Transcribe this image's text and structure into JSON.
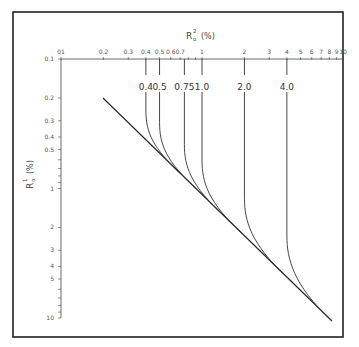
{
  "chart_data": {
    "type": "line",
    "title": "",
    "xlabel": "R_o^2 (%)",
    "ylabel": "R_o^1 (%)",
    "x_scale": "log",
    "y_scale": "log",
    "xlim": [
      0.1,
      10
    ],
    "ylim": [
      0.1,
      10
    ],
    "y_inverted": true,
    "x_axis_position": "top",
    "grid": false,
    "x_ticks": [
      {
        "value": 0.1,
        "label": "01"
      },
      {
        "value": 0.2,
        "label": "0.2"
      },
      {
        "value": 0.3,
        "label": "0.3"
      },
      {
        "value": 0.4,
        "label": "0.4"
      },
      {
        "value": 0.5,
        "label": "0.5"
      },
      {
        "value": 0.6,
        "label": "0.6"
      },
      {
        "value": 0.7,
        "label": "0.7"
      },
      {
        "value": 1,
        "label": "1"
      },
      {
        "value": 2,
        "label": "2"
      },
      {
        "value": 3,
        "label": "3"
      },
      {
        "value": 4,
        "label": "4"
      },
      {
        "value": 5,
        "label": "5"
      },
      {
        "value": 6,
        "label": "6"
      },
      {
        "value": 7,
        "label": "7"
      },
      {
        "value": 8,
        "label": "8"
      },
      {
        "value": 9,
        "label": "9"
      },
      {
        "value": 10,
        "label": "10"
      }
    ],
    "y_ticks": [
      {
        "value": 0.1,
        "label": "0.1"
      },
      {
        "value": 0.2,
        "label": "0.2"
      },
      {
        "value": 0.3,
        "label": "0.3"
      },
      {
        "value": 0.4,
        "label": "0.4"
      },
      {
        "value": 0.5,
        "label": "0.5"
      },
      {
        "value": 1,
        "label": "1"
      },
      {
        "value": 2,
        "label": "2"
      },
      {
        "value": 3,
        "label": "3"
      },
      {
        "value": 4,
        "label": "4"
      },
      {
        "value": 5,
        "label": "5"
      },
      {
        "value": 10,
        "label": "10"
      }
    ],
    "diagonal_line": {
      "name": "asymptote",
      "points": [
        [
          0.2,
          0.2
        ],
        [
          8.5,
          9.5
        ]
      ]
    },
    "series": [
      {
        "name": "0.4",
        "label": "0.4",
        "asymptote_x": 0.4,
        "points": [
          [
            0.4,
            0.2
          ],
          [
            0.4,
            0.35
          ],
          [
            0.42,
            0.5
          ],
          [
            0.5,
            0.6
          ],
          [
            0.7,
            0.8
          ]
        ]
      },
      {
        "name": "0.5",
        "label": "0.5",
        "asymptote_x": 0.5,
        "points": [
          [
            0.5,
            0.2
          ],
          [
            0.5,
            0.4
          ],
          [
            0.53,
            0.6
          ],
          [
            0.65,
            0.75
          ],
          [
            0.9,
            1.0
          ]
        ]
      },
      {
        "name": "0.75",
        "label": "0.75",
        "asymptote_x": 0.75,
        "points": [
          [
            0.75,
            0.2
          ],
          [
            0.75,
            0.55
          ],
          [
            0.8,
            0.9
          ],
          [
            1.0,
            1.15
          ],
          [
            1.5,
            1.6
          ]
        ]
      },
      {
        "name": "1.0",
        "label": "1.0",
        "asymptote_x": 1.0,
        "points": [
          [
            1.0,
            0.2
          ],
          [
            1.0,
            0.7
          ],
          [
            1.07,
            1.1
          ],
          [
            1.4,
            1.5
          ],
          [
            2.0,
            2.1
          ]
        ]
      },
      {
        "name": "2.0",
        "label": "2.0",
        "asymptote_x": 2.0,
        "points": [
          [
            2.0,
            0.2
          ],
          [
            2.0,
            1.2
          ],
          [
            2.05,
            1.9
          ],
          [
            2.5,
            2.6
          ],
          [
            3.2,
            3.4
          ]
        ]
      },
      {
        "name": "4.0",
        "label": "4.0",
        "asymptote_x": 4.0,
        "points": [
          [
            4.0,
            0.2
          ],
          [
            4.0,
            2.5
          ],
          [
            4.1,
            3.6
          ],
          [
            4.7,
            4.7
          ],
          [
            5.5,
            5.7
          ]
        ]
      }
    ]
  },
  "labels": {
    "x_axis_title_main": "R",
    "x_axis_title_sup": "2",
    "x_axis_title_sub": "o",
    "x_axis_title_unit": "(%)",
    "y_axis_title_main": "R",
    "y_axis_title_sup": "1",
    "y_axis_title_sub": "o",
    "y_axis_title_unit": "(%)",
    "x_origin_label": "0.1"
  }
}
